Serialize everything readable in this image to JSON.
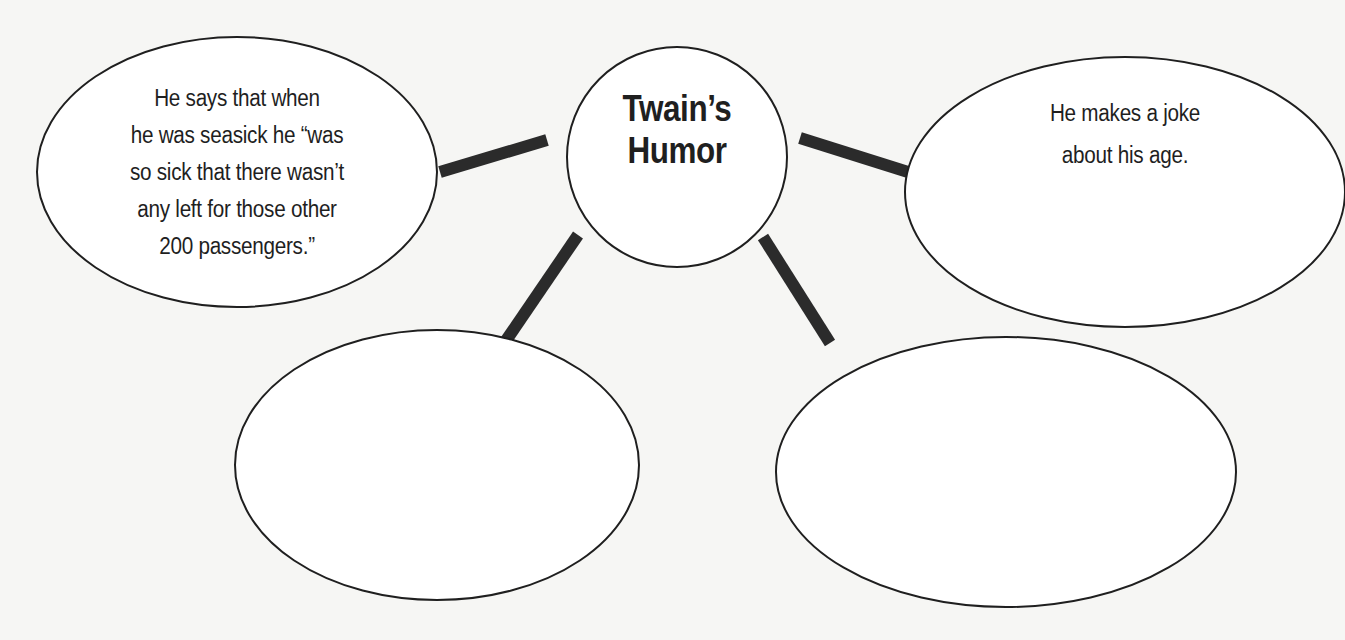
{
  "diagram": {
    "type": "cluster-web",
    "center": {
      "label_lines": [
        "Twain’s",
        "Humor"
      ],
      "cx": 677,
      "cy": 157,
      "rx": 110,
      "ry": 110
    },
    "nodes": [
      {
        "id": "top-left",
        "lines": [
          "He says that when",
          "he was seasick he “was",
          "so sick that there wasn’t",
          "any left for those other",
          "200 passengers.”"
        ],
        "cx": 237,
        "cy": 172,
        "rx": 200,
        "ry": 135
      },
      {
        "id": "top-right",
        "lines": [
          "He makes a joke",
          "about his age."
        ],
        "cx": 1125,
        "cy": 192,
        "rx": 220,
        "ry": 135
      },
      {
        "id": "bottom-left",
        "lines": [],
        "cx": 437,
        "cy": 465,
        "rx": 202,
        "ry": 135
      },
      {
        "id": "bottom-right",
        "lines": [],
        "cx": 1006,
        "cy": 472,
        "rx": 230,
        "ry": 135
      }
    ],
    "connectors": [
      {
        "from": "center",
        "to": "top-left",
        "x1": 547,
        "y1": 140,
        "x2": 440,
        "y2": 172
      },
      {
        "from": "center",
        "to": "top-right",
        "x1": 800,
        "y1": 138,
        "x2": 908,
        "y2": 172
      },
      {
        "from": "center",
        "to": "bottom-left",
        "x1": 578,
        "y1": 235,
        "x2": 505,
        "y2": 342
      },
      {
        "from": "center",
        "to": "bottom-right",
        "x1": 763,
        "y1": 237,
        "x2": 830,
        "y2": 343
      }
    ],
    "colors": {
      "background": "#f6f6f4",
      "stroke": "#1f1f1f",
      "connector": "#2b2b2b",
      "fill": "#ffffff"
    }
  }
}
